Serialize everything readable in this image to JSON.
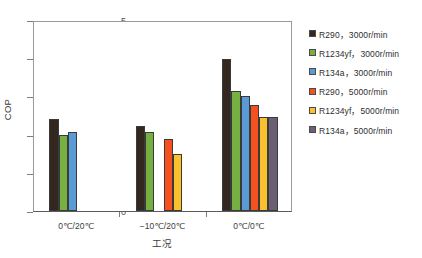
{
  "chart_data": {
    "type": "bar",
    "title": "",
    "xlabel": "工况",
    "ylabel": "COP",
    "ylim": [
      0,
      5
    ],
    "yticks": [
      0,
      1,
      2,
      3,
      4,
      5
    ],
    "grid": false,
    "legend_position": "right",
    "categories": [
      "0℃/20℃",
      "−10℃/20℃",
      "0℃/0℃"
    ],
    "series": [
      {
        "name": "R290，3000r/min",
        "color": "#332820",
        "values": [
          2.4,
          2.22,
          3.98
        ]
      },
      {
        "name": "R1234yf，3000r/min",
        "color": "#76b043",
        "values": [
          2.0,
          2.07,
          3.14
        ]
      },
      {
        "name": "R134a，3000r/min",
        "color": "#5b9bd5",
        "values": [
          2.07,
          null,
          3.01
        ]
      },
      {
        "name": "R290，5000r/min",
        "color": "#f4511e",
        "values": [
          null,
          1.88,
          2.78
        ]
      },
      {
        "name": "R1234yf，5000r/min",
        "color": "#fbc02d",
        "values": [
          null,
          1.5,
          2.45
        ]
      },
      {
        "name": "R134a，5000r/min",
        "color": "#6b5f73",
        "values": [
          null,
          null,
          2.45
        ]
      }
    ]
  },
  "axes": {
    "y_title": "COP",
    "x_title": "工况",
    "y_tick_labels": [
      "0",
      "1",
      "2",
      "3",
      "4",
      "5"
    ],
    "x_tick_labels": [
      "0℃/20℃",
      "−10℃/20℃",
      "0℃/0℃"
    ]
  },
  "legend": {
    "items": [
      {
        "label": "R290，3000r/min",
        "color": "#332820"
      },
      {
        "label": "R1234yf，3000r/min",
        "color": "#76b043"
      },
      {
        "label": "R134a，3000r/min",
        "color": "#5b9bd5"
      },
      {
        "label": "R290，5000r/min",
        "color": "#f4511e"
      },
      {
        "label": "R1234yf，5000r/min",
        "color": "#fbc02d"
      },
      {
        "label": "R134a，5000r/min",
        "color": "#6b5f73"
      }
    ]
  }
}
